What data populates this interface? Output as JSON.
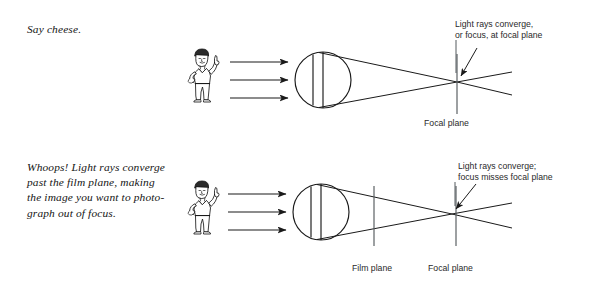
{
  "page": {
    "background_color": "#ffffff",
    "ink_color": "#1a1a1a",
    "width": 590,
    "height": 285
  },
  "panels": {
    "top": {
      "caption": "Say cheese.",
      "annotation": "Light rays converge,\nor focus, at focal plane",
      "labels": {
        "focal_plane": "Focal plane"
      },
      "figure_alt": "cartoon-photographer-pointing-up",
      "lens_alt": "double-convex-lens",
      "incoming_rays": 3,
      "focus_state": "in-focus"
    },
    "bottom": {
      "caption": "Whoops! Light rays converge past the film plane, making the image you want to photograph out of focus.",
      "caption_lines": "Whoops! Light rays converge\npast the film plane, making\nthe image you want to photo-\ngraph out of focus.",
      "annotation": "Light rays converge;\nfocus misses focal plane",
      "labels": {
        "film_plane": "Film plane",
        "focal_plane": "Focal plane"
      },
      "figure_alt": "cartoon-photographer-pointing-up",
      "lens_alt": "double-convex-lens",
      "incoming_rays": 3,
      "focus_state": "out-of-focus"
    }
  }
}
